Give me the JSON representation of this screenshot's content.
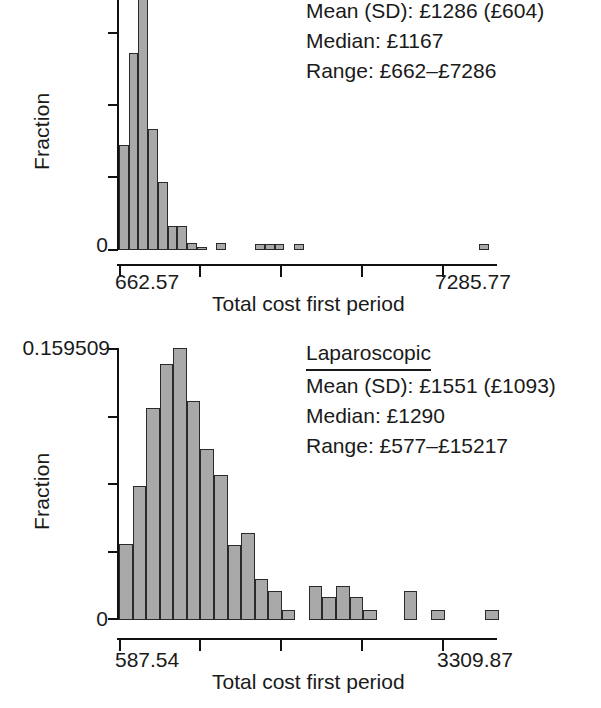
{
  "figure": {
    "panels": [
      {
        "id": "open",
        "ylabel": "Fraction",
        "y_tick_bottom": "0",
        "y_tick_top": "",
        "x_tick_left": "662.57",
        "x_tick_right": "7285.77",
        "xlabel": "Total cost first period",
        "annotation": {
          "title": "",
          "mean": "Mean (SD): £1286 (£604)",
          "median": "Median: £1167",
          "range": "Range: £662–£7286"
        }
      },
      {
        "id": "laparoscopic",
        "ylabel": "Fraction",
        "y_tick_bottom": "0",
        "y_tick_top": "0.159509",
        "x_tick_left": "587.54",
        "x_tick_right": "3309.87",
        "xlabel": "Total cost first period",
        "annotation": {
          "title": "Laparoscopic",
          "mean": "Mean (SD): £1551 (£1093)",
          "median": "Median: £1290",
          "range": "Range: £577–£15217"
        }
      }
    ]
  },
  "chart_data": [
    {
      "type": "bar",
      "id": "open-histogram",
      "title": "",
      "xlabel": "Total cost first period",
      "ylabel": "Fraction",
      "xlim": [
        662.57,
        7285.77
      ],
      "ylim": [
        0,
        0.42
      ],
      "xticks": [
        662.57,
        2318.37,
        3974.17,
        5629.97,
        7285.77
      ],
      "yticks_count": 5,
      "grid": false,
      "legend": null,
      "bin_width_frac": 0.0256,
      "note": "Top panel is vertically cropped; tallest bar runs off the top of the image.",
      "bins_x": [
        0.0,
        0.0256,
        0.0512,
        0.0768,
        0.1024,
        0.128,
        0.1536,
        0.1792,
        0.2048,
        0.2304,
        0.256,
        0.2816,
        0.3072,
        0.3328,
        0.3584,
        0.384,
        0.4096,
        0.4352,
        0.4608,
        0.4864,
        0.512,
        0.5376,
        0.5632,
        0.5888,
        0.6144,
        0.64,
        0.6656,
        0.6912,
        0.7168,
        0.7424,
        0.768,
        0.7936,
        0.8192,
        0.8448,
        0.8704,
        0.896,
        0.9216,
        0.9472,
        0.9728
      ],
      "values": [
        0.152,
        0.285,
        0.42,
        0.175,
        0.098,
        0.035,
        0.035,
        0.01,
        0.004,
        0.0,
        0.01,
        0.0,
        0.0,
        0.0,
        0.008,
        0.008,
        0.008,
        0.0,
        0.008,
        0.0,
        0.0,
        0.0,
        0.0,
        0.0,
        0.0,
        0.0,
        0.0,
        0.0,
        0.0,
        0.0,
        0.0,
        0.0,
        0.0,
        0.0,
        0.0,
        0.0,
        0.0,
        0.008,
        0.0
      ],
      "annotations": [
        "Mean (SD): £1286 (£604)",
        "Median: £1167",
        "Range: £662–£7286"
      ]
    },
    {
      "type": "bar",
      "id": "laparoscopic-histogram",
      "title": "Laparoscopic",
      "xlabel": "Total cost first period",
      "ylabel": "Fraction",
      "xlim": [
        587.54,
        3309.87
      ],
      "ylim": [
        0,
        0.159509
      ],
      "xticks": [
        587.54,
        1268.12,
        1948.7,
        2629.29,
        3309.87
      ],
      "yticks_count": 5,
      "grid": false,
      "legend": null,
      "bin_width_frac": 0.0357,
      "bins_x": [
        0.0,
        0.0357,
        0.0714,
        0.1071,
        0.1428,
        0.1785,
        0.2142,
        0.2499,
        0.2856,
        0.3213,
        0.357,
        0.3927,
        0.4284,
        0.4641,
        0.4998,
        0.5355,
        0.5712,
        0.6069,
        0.6426,
        0.6783,
        0.714,
        0.7497,
        0.7854,
        0.8211,
        0.8568,
        0.8925,
        0.9282,
        0.9639
      ],
      "values": [
        0.0448,
        0.0787,
        0.1243,
        0.1503,
        0.1595,
        0.1283,
        0.1002,
        0.0848,
        0.044,
        0.0511,
        0.0243,
        0.0172,
        0.006,
        0.0,
        0.0199,
        0.0136,
        0.0199,
        0.0136,
        0.006,
        0.0,
        0.0,
        0.0172,
        0.0,
        0.006,
        0.0,
        0.0,
        0.0,
        0.006
      ],
      "annotations": [
        "Laparoscopic",
        "Mean (SD): £1551 (£1093)",
        "Median: £1290",
        "Range: £577–£15217"
      ]
    }
  ]
}
